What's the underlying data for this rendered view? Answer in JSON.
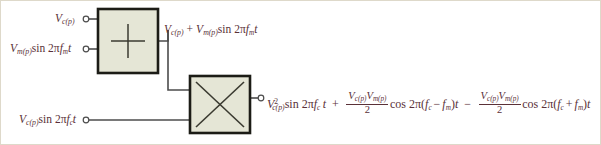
{
  "figure": {
    "frame_color": "#d9d4c4",
    "background": "#ffffff",
    "text_color": "#5a3138",
    "block_fill": "#e5e6d6",
    "block_border": "#1c1c16",
    "wire_color": "#4c4c4c"
  },
  "blocks": [
    {
      "id": "summer",
      "name": "summer-block",
      "symbol": "+",
      "x": 98,
      "y": 9,
      "width": 60,
      "height": 64
    },
    {
      "id": "multiplier",
      "name": "multiplier-block",
      "symbol": "×",
      "x": 190,
      "y": 76,
      "width": 60,
      "height": 57
    }
  ],
  "terminals": {
    "carrier_dc_in": {
      "name": "terminal-carrier-dc-input",
      "x": 85,
      "y": 19
    },
    "modulating_in": {
      "name": "terminal-modulating-input",
      "x": 85,
      "y": 49
    },
    "carrier_sine_in": {
      "name": "terminal-carrier-sine-input",
      "x": 85,
      "y": 120
    },
    "output": {
      "name": "terminal-output",
      "x": 261,
      "y": 98
    }
  },
  "labels": {
    "input_carrier_dc": {
      "name": "label-input-carrier-dc",
      "text": "Vc(p)",
      "parts": {
        "V": "V",
        "sub": "c(p)"
      }
    },
    "input_modulating": {
      "name": "label-input-modulating",
      "text": "Vm(p) sin 2πfm t",
      "parts": {
        "V": "V",
        "sub": "m(p)",
        "fn": "sin 2π",
        "f": "f",
        "fsub": "m",
        "t": "t"
      }
    },
    "input_carrier_sine": {
      "name": "label-input-carrier-sine",
      "text": "Vc(p) sin 2πfc t",
      "parts": {
        "V": "V",
        "sub": "c(p)",
        "fn": "sin 2π",
        "f": "f",
        "fsub": "c",
        "t": "t"
      }
    },
    "summer_output": {
      "name": "label-summer-output",
      "text": "Vc(p) + Vm(p) sin 2πfm t",
      "parts": {
        "V1": "V",
        "sub1": "c(p)",
        "plus": "+",
        "V2": "V",
        "sub2": "m(p)",
        "fn": "sin 2π",
        "f": "f",
        "fsub": "m",
        "t": "t"
      }
    },
    "output_equation": {
      "name": "label-output-equation",
      "text": "V²c(p) sin 2πfc t + (Vc(p)Vm(p)/2) cos 2π(fc − fm)t − (Vc(p)Vm(p)/2) cos 2π(fc + fm)t",
      "term1": {
        "V": "V",
        "sup": "2",
        "sub": "c(p)",
        "fn": "sin 2π",
        "f": "f",
        "fsub": "c",
        "t": "t"
      },
      "op1": "+",
      "term2": {
        "num_V1": "V",
        "num_sub1": "c(p)",
        "num_V2": "V",
        "num_sub2": "m(p)",
        "den": "2",
        "fn": "cos 2π(",
        "f1": "f",
        "f1sub": "c",
        "minus": "−",
        "f2": "f",
        "f2sub": "m",
        "close": ")",
        "t": "t"
      },
      "op2": "−",
      "term3": {
        "num_V1": "V",
        "num_sub1": "c(p)",
        "num_V2": "V",
        "num_sub2": "m(p)",
        "den": "2",
        "fn": "cos 2π(",
        "f1": "f",
        "f1sub": "c",
        "plus": "+",
        "f2": "f",
        "f2sub": "m",
        "close": ")",
        "t": "t"
      }
    }
  }
}
